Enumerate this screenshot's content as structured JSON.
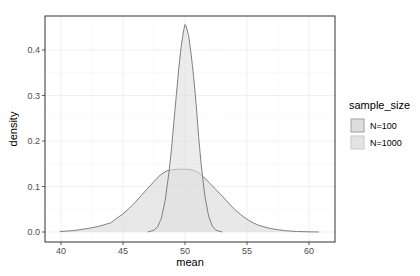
{
  "chart_data": {
    "type": "area",
    "title": "",
    "xlabel": "mean",
    "ylabel": "density",
    "xlim": [
      39,
      61.5
    ],
    "ylim": [
      -0.02,
      0.475
    ],
    "xticks": [
      40,
      45,
      50,
      55,
      60
    ],
    "yticks": [
      0.0,
      0.1,
      0.2,
      0.3,
      0.4
    ],
    "xtick_labels": [
      "40",
      "45",
      "50",
      "55",
      "60"
    ],
    "ytick_labels": [
      "0.0",
      "0.1",
      "0.2",
      "0.3",
      "0.4"
    ],
    "grid": true,
    "legend": {
      "title": "sample_size",
      "position": "right",
      "entries": [
        "N=100",
        "N=1000"
      ]
    },
    "series": [
      {
        "name": "N=100",
        "fill": "#d9d9d9",
        "stroke": "#808080",
        "x": [
          39.9,
          41,
          42,
          43,
          44,
          44.5,
          45,
          45.5,
          46,
          46.5,
          47,
          47.5,
          48,
          48.5,
          49,
          49.5,
          50,
          50.5,
          51,
          51.5,
          52,
          52.5,
          53,
          53.5,
          54,
          54.5,
          55,
          55.5,
          56,
          57,
          58,
          59,
          60,
          60.8
        ],
        "y": [
          0.001,
          0.003,
          0.007,
          0.012,
          0.02,
          0.03,
          0.04,
          0.052,
          0.066,
          0.081,
          0.096,
          0.111,
          0.125,
          0.134,
          0.137,
          0.138,
          0.138,
          0.137,
          0.132,
          0.121,
          0.107,
          0.093,
          0.079,
          0.064,
          0.05,
          0.038,
          0.028,
          0.02,
          0.014,
          0.007,
          0.003,
          0.001,
          0.0005,
          0.0
        ]
      },
      {
        "name": "N=1000",
        "fill": "#e0e0e0",
        "stroke": "#808080",
        "x": [
          47.0,
          47.5,
          47.8,
          48.1,
          48.4,
          48.7,
          48.9,
          49.1,
          49.3,
          49.5,
          49.7,
          49.9,
          50.0,
          50.1,
          50.3,
          50.5,
          50.7,
          50.9,
          51.1,
          51.3,
          51.6,
          51.9,
          52.2,
          52.5,
          53.0
        ],
        "y": [
          0.0,
          0.004,
          0.012,
          0.03,
          0.07,
          0.13,
          0.18,
          0.24,
          0.3,
          0.36,
          0.41,
          0.445,
          0.456,
          0.452,
          0.43,
          0.39,
          0.34,
          0.28,
          0.21,
          0.15,
          0.08,
          0.035,
          0.013,
          0.004,
          0.0
        ]
      }
    ]
  }
}
